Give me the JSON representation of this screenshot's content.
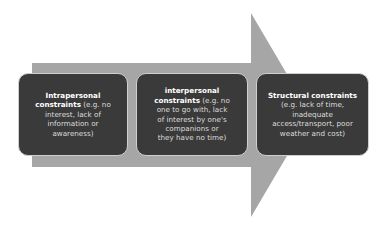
{
  "arrow": {
    "color": "#a6a6a6"
  },
  "boxes": [
    {
      "title": "Intrapersonal constraints",
      "title_line1": "Intrapersonal",
      "title_line2": "constraints",
      "detail_line1": " (e.g. no",
      "detail_line2": "interest, lack of",
      "detail_line3": "information or",
      "detail_line4": "awareness)"
    },
    {
      "title": "interpersonal constraints",
      "title_line1": "interpersonal",
      "title_line2": "constraints",
      "detail_line1": " (e.g. no",
      "detail_line2": "one to go with, lack",
      "detail_line3": "of interest by one's",
      "detail_line4": "companions or",
      "detail_line5": "they have no time)"
    },
    {
      "title": "Structural constraints",
      "title_line1": "Structural constraints",
      "detail_line1": "(e.g. lack of time,",
      "detail_line2": "inadequate",
      "detail_line3": "access/transport, poor",
      "detail_line4": "weather and cost)"
    }
  ],
  "colors": {
    "box_fill": "#3a3a3a",
    "box_border": "#cfcfcf",
    "arrow": "#a6a6a6",
    "title_text": "#ffffff",
    "detail_text": "#dcdcdc"
  }
}
